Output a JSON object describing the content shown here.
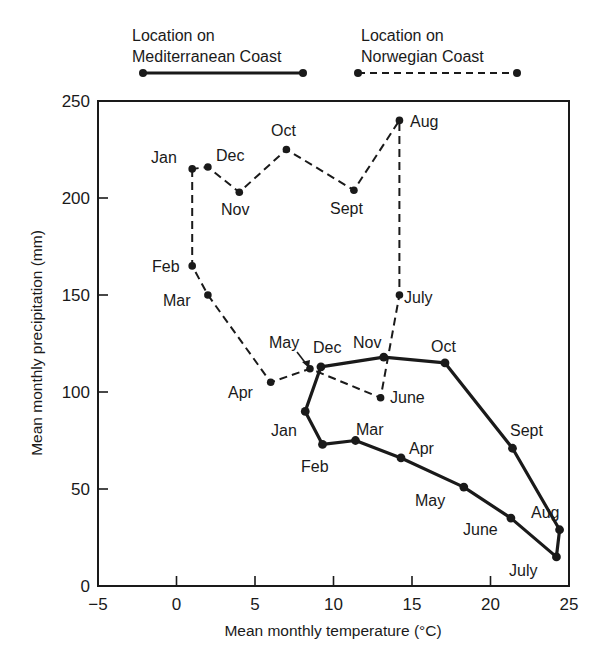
{
  "chart_data": {
    "type": "line",
    "title": "",
    "xlabel": "Mean monthly temperature (°C)",
    "ylabel": "Mean monthly precipitation (mm)",
    "xlim": [
      -5,
      25
    ],
    "ylim": [
      0,
      250
    ],
    "xticks": [
      -5,
      0,
      5,
      10,
      15,
      20,
      25
    ],
    "yticks": [
      0,
      50,
      100,
      150,
      200,
      250
    ],
    "grid": false,
    "legend_position": "top",
    "series": [
      {
        "name": "Location on Mediterranean Coast",
        "style": "solid",
        "closed": true,
        "points": [
          {
            "month": "Jan",
            "temp": 8.2,
            "precip": 90
          },
          {
            "month": "Feb",
            "temp": 9.3,
            "precip": 73
          },
          {
            "month": "Mar",
            "temp": 11.4,
            "precip": 75
          },
          {
            "month": "Apr",
            "temp": 14.3,
            "precip": 66
          },
          {
            "month": "May",
            "temp": 18.3,
            "precip": 51
          },
          {
            "month": "June",
            "temp": 21.3,
            "precip": 35
          },
          {
            "month": "July",
            "temp": 24.2,
            "precip": 15
          },
          {
            "month": "Aug",
            "temp": 24.4,
            "precip": 29
          },
          {
            "month": "Sept",
            "temp": 21.4,
            "precip": 71
          },
          {
            "month": "Oct",
            "temp": 17.1,
            "precip": 115
          },
          {
            "month": "Nov",
            "temp": 13.2,
            "precip": 118
          },
          {
            "month": "Dec",
            "temp": 9.2,
            "precip": 113
          }
        ]
      },
      {
        "name": "Location on Norwegian Coast",
        "style": "dashed",
        "closed": true,
        "points": [
          {
            "month": "Jan",
            "temp": 1.0,
            "precip": 215
          },
          {
            "month": "Feb",
            "temp": 1.0,
            "precip": 165
          },
          {
            "month": "Mar",
            "temp": 2.0,
            "precip": 150
          },
          {
            "month": "Apr",
            "temp": 6.0,
            "precip": 105
          },
          {
            "month": "May",
            "temp": 8.5,
            "precip": 112
          },
          {
            "month": "June",
            "temp": 13.0,
            "precip": 97
          },
          {
            "month": "July",
            "temp": 14.2,
            "precip": 150
          },
          {
            "month": "Aug",
            "temp": 14.2,
            "precip": 240
          },
          {
            "month": "Sept",
            "temp": 11.3,
            "precip": 204
          },
          {
            "month": "Oct",
            "temp": 7.0,
            "precip": 225
          },
          {
            "month": "Nov",
            "temp": 4.0,
            "precip": 203
          },
          {
            "month": "Dec",
            "temp": 2.0,
            "precip": 216
          }
        ]
      }
    ]
  },
  "legend": {
    "mediterranean": {
      "line1": "Location on",
      "line2": "Mediterranean Coast"
    },
    "norwegian": {
      "line1": "Location on",
      "line2": "Norwegian Coast"
    }
  },
  "axes": {
    "x_title": "Mean monthly temperature (°C)",
    "y_title": "Mean monthly precipitation (mm)",
    "x_tick_labels": [
      "−5",
      "0",
      "5",
      "10",
      "15",
      "20",
      "25"
    ],
    "y_tick_labels": [
      "0",
      "50",
      "100",
      "150",
      "200",
      "250"
    ]
  },
  "labels": {
    "norwegian": {
      "Jan": "Jan",
      "Feb": "Feb",
      "Mar": "Mar",
      "Apr": "Apr",
      "May": "May",
      "June": "June",
      "July": "July",
      "Aug": "Aug",
      "Sept": "Sept",
      "Oct": "Oct",
      "Nov": "Nov",
      "Dec": "Dec"
    },
    "mediterranean": {
      "Jan": "Jan",
      "Feb": "Feb",
      "Mar": "Mar",
      "Apr": "Apr",
      "May": "May",
      "June": "June",
      "July": "July",
      "Aug": "Aug",
      "Sept": "Sept",
      "Oct": "Oct",
      "Nov": "Nov",
      "Dec": "Dec"
    }
  },
  "colors": {
    "ink": "#1a1a1a",
    "background": "#ffffff"
  }
}
